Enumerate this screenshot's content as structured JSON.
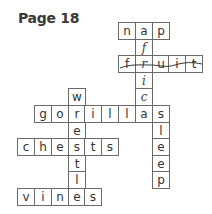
{
  "title": "Page 18",
  "grid": {
    "origin_x": 34,
    "origin_y": 22,
    "step_x": 16.8,
    "step_y": 16.6
  },
  "words": [
    {
      "word": "nap",
      "direction": "across",
      "row": 0,
      "col": 5
    },
    {
      "word": "fruit",
      "direction": "across",
      "row": 2,
      "col": 5
    },
    {
      "word": "gorillas",
      "direction": "across",
      "row": 5,
      "col": 0
    },
    {
      "word": "chests",
      "direction": "across",
      "row": 7,
      "col": -1
    },
    {
      "word": "vines",
      "direction": "across",
      "row": 10,
      "col": -1
    },
    {
      "word": "africa",
      "direction": "down",
      "row": 0,
      "col": 6,
      "handwritten": true
    },
    {
      "word": "wrestle",
      "direction": "down",
      "row": 4,
      "col": 2
    },
    {
      "word": "sleep",
      "direction": "down",
      "row": 5,
      "col": 7
    }
  ],
  "cells": [
    {
      "r": 0,
      "c": 5,
      "ch": "n"
    },
    {
      "r": 0,
      "c": 6,
      "ch": "a"
    },
    {
      "r": 0,
      "c": 7,
      "ch": "p"
    },
    {
      "r": 1,
      "c": 6,
      "ch": "f",
      "hand": true
    },
    {
      "r": 2,
      "c": 5,
      "ch": "f"
    },
    {
      "r": 2,
      "c": 6,
      "ch": "r",
      "hand": true
    },
    {
      "r": 2,
      "c": 7,
      "ch": "u"
    },
    {
      "r": 2,
      "c": 8,
      "ch": "i"
    },
    {
      "r": 2,
      "c": 9,
      "ch": "t"
    },
    {
      "r": 3,
      "c": 6,
      "ch": "i",
      "hand": true
    },
    {
      "r": 4,
      "c": 2,
      "ch": "w"
    },
    {
      "r": 4,
      "c": 6,
      "ch": "c",
      "hand": true
    },
    {
      "r": 5,
      "c": 0,
      "ch": "g"
    },
    {
      "r": 5,
      "c": 1,
      "ch": "o"
    },
    {
      "r": 5,
      "c": 2,
      "ch": "r"
    },
    {
      "r": 5,
      "c": 3,
      "ch": "i"
    },
    {
      "r": 5,
      "c": 4,
      "ch": "l"
    },
    {
      "r": 5,
      "c": 5,
      "ch": "l"
    },
    {
      "r": 5,
      "c": 6,
      "ch": "a"
    },
    {
      "r": 5,
      "c": 7,
      "ch": "s"
    },
    {
      "r": 6,
      "c": 2,
      "ch": "e"
    },
    {
      "r": 6,
      "c": 7,
      "ch": "l"
    },
    {
      "r": 7,
      "c": -1,
      "ch": "c"
    },
    {
      "r": 7,
      "c": 0,
      "ch": "h"
    },
    {
      "r": 7,
      "c": 1,
      "ch": "e"
    },
    {
      "r": 7,
      "c": 2,
      "ch": "s"
    },
    {
      "r": 7,
      "c": 3,
      "ch": "t"
    },
    {
      "r": 7,
      "c": 4,
      "ch": "s"
    },
    {
      "r": 7,
      "c": 7,
      "ch": "e"
    },
    {
      "r": 8,
      "c": 2,
      "ch": "t"
    },
    {
      "r": 8,
      "c": 7,
      "ch": "e"
    },
    {
      "r": 9,
      "c": 2,
      "ch": "l"
    },
    {
      "r": 9,
      "c": 7,
      "ch": "p"
    },
    {
      "r": 10,
      "c": -1,
      "ch": "v"
    },
    {
      "r": 10,
      "c": 0,
      "ch": "i"
    },
    {
      "r": 10,
      "c": 1,
      "ch": "n"
    },
    {
      "r": 10,
      "c": 2,
      "ch": "e"
    },
    {
      "r": 10,
      "c": 3,
      "ch": "s"
    }
  ],
  "colors": {
    "text": "#333333",
    "border": "#6a6a6a",
    "background": "#ffffff"
  }
}
